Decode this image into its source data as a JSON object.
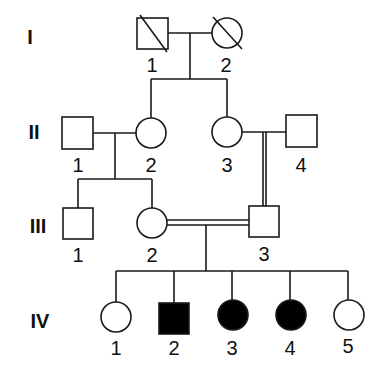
{
  "diagram": {
    "type": "pedigree",
    "colors": {
      "line": "#1a1a1a",
      "affected": "#000000",
      "unaffected": "#ffffff"
    },
    "generations": [
      {
        "label": "I",
        "x": 30,
        "y": 44
      },
      {
        "label": "II",
        "x": 34,
        "y": 139
      },
      {
        "label": "III",
        "x": 38,
        "y": 233
      },
      {
        "label": "IV",
        "x": 40,
        "y": 328
      }
    ],
    "individuals": [
      {
        "id": "I-1",
        "number": "1",
        "sex": "male",
        "affected": false,
        "deceased": true,
        "cx": 152,
        "cy": 33
      },
      {
        "id": "I-2",
        "number": "2",
        "sex": "female",
        "affected": false,
        "deceased": true,
        "cx": 227,
        "cy": 33
      },
      {
        "id": "II-1",
        "number": "1",
        "sex": "male",
        "affected": false,
        "deceased": false,
        "cx": 78,
        "cy": 133
      },
      {
        "id": "II-2",
        "number": "2",
        "sex": "female",
        "affected": false,
        "deceased": false,
        "cx": 151,
        "cy": 133
      },
      {
        "id": "II-3",
        "number": "3",
        "sex": "female",
        "affected": false,
        "deceased": false,
        "cx": 227,
        "cy": 132
      },
      {
        "id": "II-4",
        "number": "4",
        "sex": "male",
        "affected": false,
        "deceased": false,
        "cx": 301,
        "cy": 131
      },
      {
        "id": "III-1",
        "number": "1",
        "sex": "male",
        "affected": false,
        "deceased": false,
        "cx": 78,
        "cy": 223
      },
      {
        "id": "III-2",
        "number": "2",
        "sex": "female",
        "affected": false,
        "deceased": false,
        "cx": 152,
        "cy": 223
      },
      {
        "id": "III-3",
        "number": "3",
        "sex": "male",
        "affected": false,
        "deceased": false,
        "cx": 264,
        "cy": 221
      },
      {
        "id": "IV-1",
        "number": "1",
        "sex": "female",
        "affected": false,
        "deceased": false,
        "cx": 116,
        "cy": 317
      },
      {
        "id": "IV-2",
        "number": "2",
        "sex": "male",
        "affected": true,
        "deceased": false,
        "cx": 174,
        "cy": 318
      },
      {
        "id": "IV-3",
        "number": "3",
        "sex": "female",
        "affected": true,
        "deceased": false,
        "cx": 233,
        "cy": 315
      },
      {
        "id": "IV-4",
        "number": "4",
        "sex": "female",
        "affected": true,
        "deceased": false,
        "cx": 291,
        "cy": 315
      },
      {
        "id": "IV-5",
        "number": "5",
        "sex": "female",
        "affected": false,
        "deceased": false,
        "cx": 349,
        "cy": 315
      }
    ],
    "relationships": [
      {
        "partners": [
          "I-1",
          "I-2"
        ],
        "consanguineous": false,
        "children": [
          "II-2",
          "II-3"
        ]
      },
      {
        "partners": [
          "II-1",
          "II-2"
        ],
        "consanguineous": false,
        "children": [
          "III-1",
          "III-2"
        ]
      },
      {
        "partners": [
          "II-3",
          "II-4"
        ],
        "consanguineous": false,
        "children": [
          "III-3"
        ],
        "descent_line": "double"
      },
      {
        "partners": [
          "III-2",
          "III-3"
        ],
        "consanguineous": true,
        "children": [
          "IV-1",
          "IV-2",
          "IV-3",
          "IV-4",
          "IV-5"
        ]
      }
    ]
  }
}
